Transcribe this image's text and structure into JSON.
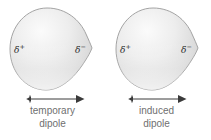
{
  "figure": {
    "background_color": "#ffffff",
    "blob_fill_light": "#f3f3f3",
    "blob_fill_mid": "#d8d8d8",
    "blob_fill_dark": "#c4c4c4",
    "blob_outline_color": "#9a9a9a",
    "label_color": "#6f6f6f",
    "delta_color": "#2b2b2b",
    "arrow_color": "#3a3a3a"
  },
  "panels": [
    {
      "id": "temporary",
      "charge_positive": "δ",
      "charge_positive_sign": "+",
      "charge_negative": "δ",
      "charge_negative_sign": "−",
      "caption_line1": "temporary",
      "caption_line2": "dipole",
      "arrow_name": "dipole-direction-arrow"
    },
    {
      "id": "induced",
      "charge_positive": "δ",
      "charge_positive_sign": "+",
      "charge_negative": "δ",
      "charge_negative_sign": "−",
      "caption_line1": "induced",
      "caption_line2": "dipole",
      "arrow_name": "dipole-direction-arrow"
    }
  ]
}
